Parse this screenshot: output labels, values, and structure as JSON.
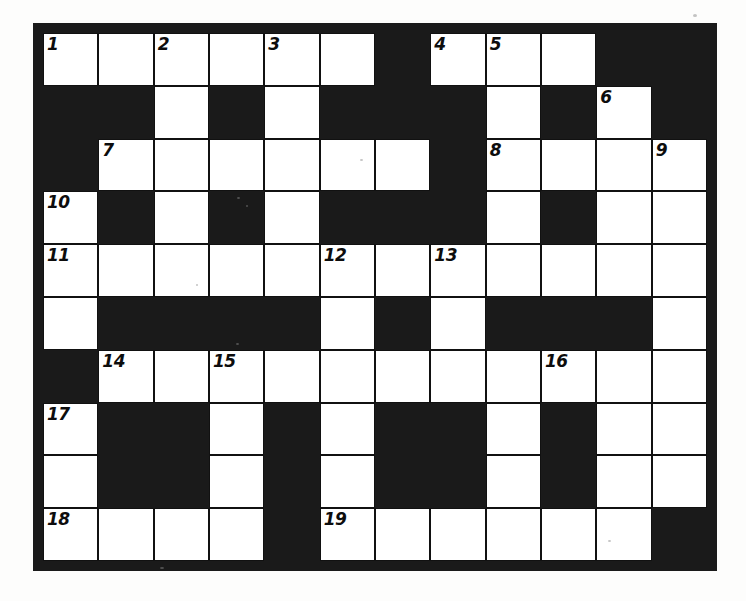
{
  "puzzle": {
    "title": "Crossword Puzzle Grid",
    "columns": 12,
    "rows": 10,
    "colors": {
      "block": "#1a1a1a",
      "cell": "#ffffff",
      "grid_line": "#111111",
      "number_text": "#0d0d0d",
      "page_background": "#fdfdfc"
    },
    "legend": {
      "white_cell": "white-cell",
      "black_cell": "block-cell"
    },
    "clue_numbers": [
      1,
      2,
      3,
      4,
      5,
      6,
      7,
      8,
      9,
      10,
      11,
      12,
      13,
      14,
      15,
      16,
      17,
      18,
      19
    ],
    "cells": [
      [
        {
          "state": "white",
          "number": "1"
        },
        {
          "state": "white",
          "number": ""
        },
        {
          "state": "white",
          "number": "2"
        },
        {
          "state": "white",
          "number": ""
        },
        {
          "state": "white",
          "number": "3"
        },
        {
          "state": "white",
          "number": ""
        },
        {
          "state": "black",
          "number": ""
        },
        {
          "state": "white",
          "number": "4"
        },
        {
          "state": "white",
          "number": "5"
        },
        {
          "state": "white",
          "number": ""
        },
        {
          "state": "black",
          "number": ""
        },
        {
          "state": "black",
          "number": ""
        }
      ],
      [
        {
          "state": "black",
          "number": ""
        },
        {
          "state": "black",
          "number": ""
        },
        {
          "state": "white",
          "number": ""
        },
        {
          "state": "black",
          "number": ""
        },
        {
          "state": "white",
          "number": ""
        },
        {
          "state": "black",
          "number": ""
        },
        {
          "state": "black",
          "number": ""
        },
        {
          "state": "black",
          "number": ""
        },
        {
          "state": "white",
          "number": ""
        },
        {
          "state": "black",
          "number": ""
        },
        {
          "state": "white",
          "number": "6"
        },
        {
          "state": "black",
          "number": ""
        }
      ],
      [
        {
          "state": "black",
          "number": ""
        },
        {
          "state": "white",
          "number": "7"
        },
        {
          "state": "white",
          "number": ""
        },
        {
          "state": "white",
          "number": ""
        },
        {
          "state": "white",
          "number": ""
        },
        {
          "state": "white",
          "number": ""
        },
        {
          "state": "white",
          "number": ""
        },
        {
          "state": "black",
          "number": ""
        },
        {
          "state": "white",
          "number": "8"
        },
        {
          "state": "white",
          "number": ""
        },
        {
          "state": "white",
          "number": ""
        },
        {
          "state": "white",
          "number": "9"
        }
      ],
      [
        {
          "state": "white",
          "number": "10"
        },
        {
          "state": "black",
          "number": ""
        },
        {
          "state": "white",
          "number": ""
        },
        {
          "state": "black",
          "number": ""
        },
        {
          "state": "white",
          "number": ""
        },
        {
          "state": "black",
          "number": ""
        },
        {
          "state": "black",
          "number": ""
        },
        {
          "state": "black",
          "number": ""
        },
        {
          "state": "white",
          "number": ""
        },
        {
          "state": "black",
          "number": ""
        },
        {
          "state": "white",
          "number": ""
        },
        {
          "state": "white",
          "number": ""
        }
      ],
      [
        {
          "state": "white",
          "number": "11"
        },
        {
          "state": "white",
          "number": ""
        },
        {
          "state": "white",
          "number": ""
        },
        {
          "state": "white",
          "number": ""
        },
        {
          "state": "white",
          "number": ""
        },
        {
          "state": "white",
          "number": "12"
        },
        {
          "state": "white",
          "number": ""
        },
        {
          "state": "white",
          "number": "13"
        },
        {
          "state": "white",
          "number": ""
        },
        {
          "state": "white",
          "number": ""
        },
        {
          "state": "white",
          "number": ""
        },
        {
          "state": "white",
          "number": ""
        }
      ],
      [
        {
          "state": "white",
          "number": ""
        },
        {
          "state": "black",
          "number": ""
        },
        {
          "state": "black",
          "number": ""
        },
        {
          "state": "black",
          "number": ""
        },
        {
          "state": "black",
          "number": ""
        },
        {
          "state": "white",
          "number": ""
        },
        {
          "state": "black",
          "number": ""
        },
        {
          "state": "white",
          "number": ""
        },
        {
          "state": "black",
          "number": ""
        },
        {
          "state": "black",
          "number": ""
        },
        {
          "state": "black",
          "number": ""
        },
        {
          "state": "white",
          "number": ""
        }
      ],
      [
        {
          "state": "black",
          "number": ""
        },
        {
          "state": "white",
          "number": "14"
        },
        {
          "state": "white",
          "number": ""
        },
        {
          "state": "white",
          "number": "15"
        },
        {
          "state": "white",
          "number": ""
        },
        {
          "state": "white",
          "number": ""
        },
        {
          "state": "white",
          "number": ""
        },
        {
          "state": "white",
          "number": ""
        },
        {
          "state": "white",
          "number": ""
        },
        {
          "state": "white",
          "number": "16"
        },
        {
          "state": "white",
          "number": ""
        },
        {
          "state": "white",
          "number": ""
        }
      ],
      [
        {
          "state": "white",
          "number": "17"
        },
        {
          "state": "black",
          "number": ""
        },
        {
          "state": "black",
          "number": ""
        },
        {
          "state": "white",
          "number": ""
        },
        {
          "state": "black",
          "number": ""
        },
        {
          "state": "white",
          "number": ""
        },
        {
          "state": "black",
          "number": ""
        },
        {
          "state": "black",
          "number": ""
        },
        {
          "state": "white",
          "number": ""
        },
        {
          "state": "black",
          "number": ""
        },
        {
          "state": "white",
          "number": ""
        },
        {
          "state": "white",
          "number": ""
        }
      ],
      [
        {
          "state": "white",
          "number": ""
        },
        {
          "state": "black",
          "number": ""
        },
        {
          "state": "black",
          "number": ""
        },
        {
          "state": "white",
          "number": ""
        },
        {
          "state": "black",
          "number": ""
        },
        {
          "state": "white",
          "number": ""
        },
        {
          "state": "black",
          "number": ""
        },
        {
          "state": "black",
          "number": ""
        },
        {
          "state": "white",
          "number": ""
        },
        {
          "state": "black",
          "number": ""
        },
        {
          "state": "white",
          "number": ""
        },
        {
          "state": "white",
          "number": ""
        }
      ],
      [
        {
          "state": "white",
          "number": "18"
        },
        {
          "state": "white",
          "number": ""
        },
        {
          "state": "white",
          "number": ""
        },
        {
          "state": "white",
          "number": ""
        },
        {
          "state": "black",
          "number": ""
        },
        {
          "state": "white",
          "number": "19"
        },
        {
          "state": "white",
          "number": ""
        },
        {
          "state": "white",
          "number": ""
        },
        {
          "state": "white",
          "number": ""
        },
        {
          "state": "white",
          "number": ""
        },
        {
          "state": "white",
          "number": ""
        },
        {
          "state": "black",
          "number": ""
        }
      ]
    ]
  }
}
